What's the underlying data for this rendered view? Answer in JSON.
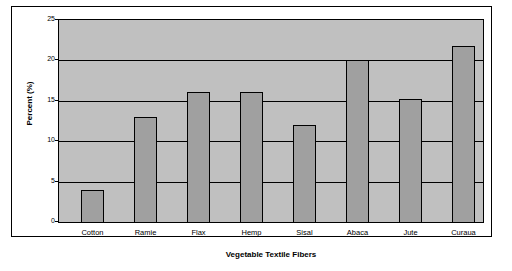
{
  "chart_data": {
    "type": "bar",
    "title": "",
    "xlabel": "Vegetable Textile Fibers",
    "ylabel": "Percent (%)",
    "categories": [
      "Cotton",
      "Ramie",
      "Flax",
      "Hemp",
      "Sisal",
      "Abaca",
      "Jute",
      "Curaua"
    ],
    "values": [
      4,
      13,
      16,
      16,
      12,
      20,
      15.2,
      21.7
    ],
    "ylim": [
      0,
      25
    ],
    "yticks": [
      0,
      5,
      10,
      15,
      20,
      25
    ],
    "ytick_labels": [
      "0",
      "5",
      "10",
      "15",
      "20",
      "25"
    ],
    "grid": true,
    "legend": "none",
    "colors": {
      "bar_fill": "#a0a0a0",
      "bar_border": "#000000",
      "plot_background": "#c0c0c0",
      "gridline": "#000000",
      "frame": "#000000",
      "text": "#000000",
      "page_background": "#ffffff"
    }
  }
}
